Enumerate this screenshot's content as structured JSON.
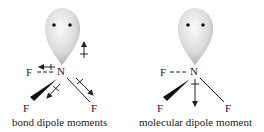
{
  "panels": [
    {
      "caption": "bond dipole moments",
      "central_atom": "N",
      "atoms": [
        "F",
        "F",
        "F"
      ],
      "lone_pair": "lone-pair-lobe"
    },
    {
      "caption": "molecular dipole moment",
      "central_atom": "N",
      "atoms": [
        "F",
        "F",
        "F"
      ],
      "lone_pair": "lone-pair-lobe"
    }
  ],
  "colors": {
    "lobe_light": "#f4f4f4",
    "lobe_dark": "#b8b8b8",
    "ink": "#222222"
  }
}
